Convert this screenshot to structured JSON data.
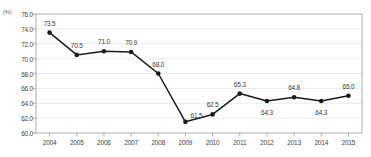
{
  "chart_data": {
    "type": "line",
    "title": "",
    "subtitle": "",
    "xlabel": "",
    "ylabel": "",
    "unit_label": "(%)",
    "categories": [
      "2004",
      "2005",
      "2006",
      "2007",
      "2008",
      "2009",
      "2010",
      "2011",
      "2012",
      "2013",
      "2014",
      "2015"
    ],
    "values": [
      73.5,
      70.5,
      71.0,
      70.9,
      68.0,
      61.5,
      62.5,
      65.3,
      64.3,
      64.8,
      64.3,
      65.0
    ],
    "point_labels": [
      "73.5",
      "70.5",
      "71.0",
      "70.9",
      "68.0",
      "61.5",
      "62.5",
      "65.3",
      "64.3",
      "64.8",
      "64.3",
      "65.0"
    ],
    "label_positions": [
      "above",
      "above",
      "above",
      "above",
      "above",
      "right-above",
      "above",
      "above",
      "below",
      "above",
      "below",
      "above"
    ],
    "ylim": [
      60.0,
      76.0
    ],
    "ytick_step": 2.0,
    "ytick_labels": [
      "76.0",
      "74.0",
      "72.0",
      "70.0",
      "68.0",
      "66.0",
      "64.0",
      "62.0",
      "60.0"
    ],
    "ytick_values": [
      76.0,
      74.0,
      72.0,
      70.0,
      68.0,
      66.0,
      64.0,
      62.0,
      60.0
    ],
    "grid": true,
    "legend": "none",
    "series": [
      {
        "name": "",
        "values": [
          73.5,
          70.5,
          71.0,
          70.9,
          68.0,
          61.5,
          62.5,
          65.3,
          64.3,
          64.8,
          64.3,
          65.0
        ]
      }
    ],
    "colors": {
      "line": "#1a1a1a",
      "marker": "#1a1a1a",
      "grid": "#e2e2e2",
      "axis": "#8c8c8c",
      "text": "#3a3a3a"
    }
  }
}
